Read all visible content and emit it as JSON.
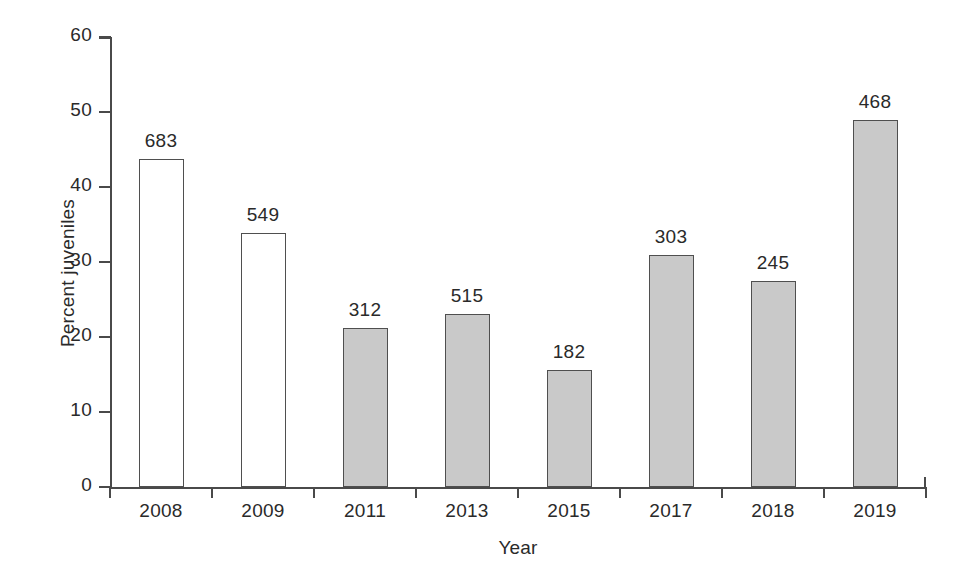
{
  "chart_data": {
    "type": "bar",
    "title": "",
    "xlabel": "Year",
    "ylabel": "Percent juveniles",
    "categories": [
      "2008",
      "2009",
      "2011",
      "2013",
      "2015",
      "2017",
      "2018",
      "2019"
    ],
    "values": [
      43.7,
      33.9,
      21.2,
      23.1,
      15.6,
      30.9,
      27.5,
      49.0
    ],
    "point_labels": [
      "683",
      "549",
      "312",
      "515",
      "182",
      "303",
      "245",
      "468"
    ],
    "point_label_meaning": "sample size (n) shown above each bar",
    "bar_styles": [
      "open",
      "open",
      "solid",
      "solid",
      "solid",
      "solid",
      "solid",
      "solid"
    ],
    "ylim": [
      0,
      60
    ],
    "yticks": [
      0,
      10,
      20,
      30,
      40,
      50,
      60
    ],
    "ytick_labels": [
      "0",
      "10",
      "20",
      "30",
      "40",
      "50",
      "60"
    ],
    "grid": false,
    "legend": null,
    "colors": {
      "open_fill": "#ffffff",
      "solid_fill": "#c9c9c9",
      "bar_outline": "#4f4f4f",
      "axis": "#4a4a4a",
      "text": "#2a2a2a",
      "background": "#ffffff"
    }
  }
}
